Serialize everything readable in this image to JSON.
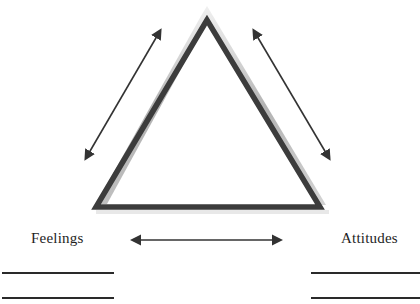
{
  "diagram": {
    "type": "triangle-relationship",
    "vertices": {
      "top": {
        "label": ""
      },
      "bottom_left": {
        "label": "Feelings"
      },
      "bottom_right": {
        "label": "Attitudes"
      }
    },
    "arrows": [
      {
        "id": "left-diagonal",
        "direction": "bidirectional"
      },
      {
        "id": "right-diagonal",
        "direction": "bidirectional"
      },
      {
        "id": "bottom-horizontal",
        "direction": "bidirectional"
      }
    ],
    "answer_lines": {
      "left_count": 2,
      "right_count": 2
    },
    "colors": {
      "triangle_stroke": "#3c3c3c",
      "triangle_glow": "#c8c8c8",
      "arrow": "#333333",
      "text": "#1e1e1e",
      "line": "#2a2a2a"
    }
  }
}
